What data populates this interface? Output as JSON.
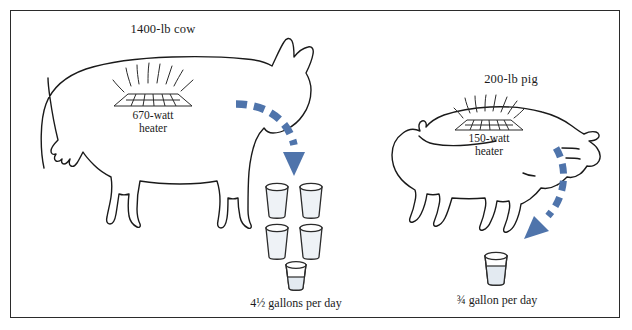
{
  "figure": {
    "border_color": "#2b2b2b",
    "background": "#ffffff",
    "outline_color": "#1a1a1a",
    "arrow_color": "#4f74ab",
    "bucket_fill": "#eef2f6",
    "bucket_water": "#e3eaf1"
  },
  "cow": {
    "title": "1400-lb cow",
    "heater_watts": "670-watt",
    "heater_word": "heater",
    "output_caption": "4½ gallons per day",
    "full_buckets": 4,
    "partial_bucket_fraction": 0.5,
    "gallons_per_day": 4.5
  },
  "pig": {
    "title": "200-lb pig",
    "heater_watts": "150-watt",
    "heater_word": "heater",
    "output_caption": "¾ gallon per day",
    "full_buckets": 0,
    "partial_bucket_fraction": 0.75,
    "gallons_per_day": 0.75
  }
}
